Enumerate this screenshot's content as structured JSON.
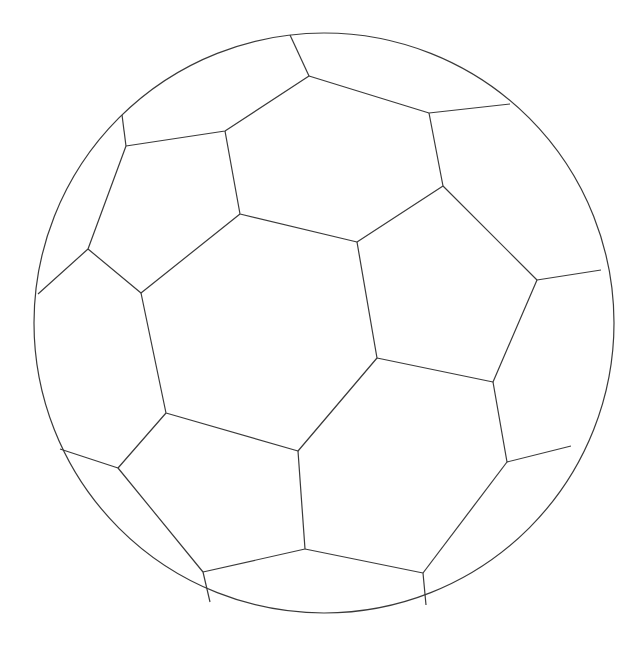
{
  "image": {
    "subject": "soccer ball line drawing",
    "background_color": "#ffffff",
    "stroke_color": "#3a3a3a",
    "stroke_width": 1.2,
    "ball": {
      "cx": 324,
      "cy": 323,
      "r": 290
    },
    "seams": [
      "290,35 309,76",
      "122,115 126,146",
      "126,146 225,131 309,76 429,113 510,104",
      "225,131 240,214 357,242 443,186 429,113",
      "126,146 88,249 38,294",
      "88,249 141,293 240,214",
      "141,293 166,413 298,451 377,358 357,242",
      "443,186 537,280 601,270",
      "537,280 493,382 377,358",
      "493,382 507,462 571,446",
      "166,413 118,468 60,449",
      "118,468 203,572 210,602",
      "298,451 305,549 203,572",
      "305,549 423,573 426,605",
      "423,573 507,462"
    ]
  },
  "caption_fragment": ""
}
